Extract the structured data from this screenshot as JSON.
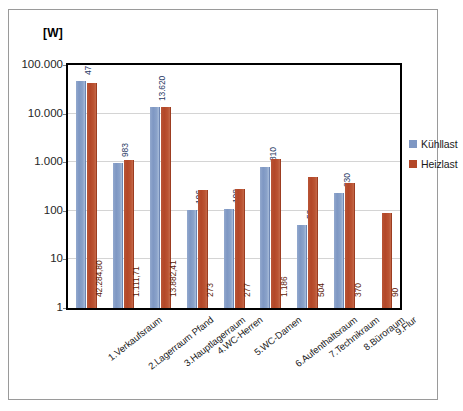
{
  "chart_data": {
    "type": "bar",
    "title": "",
    "subtitle": "",
    "unit_label": "[W]",
    "xlabel": "",
    "ylabel": "",
    "yscale": "log",
    "ylim": [
      1,
      100000
    ],
    "grid": true,
    "legend_position": "right",
    "ytick_labels": [
      "100.000",
      "10.000",
      "1.000",
      "100",
      "10",
      "1"
    ],
    "ytick_values": [
      100000,
      10000,
      1000,
      100,
      10,
      1
    ],
    "categories": [
      "1.Verkaufsraum",
      "2.Lagerraum Pfand",
      "3.Hauptlagerraum",
      "4.WC-Herren",
      "5.WC-Damen",
      "6.Aufenthaltsraum",
      "7.Technikraum",
      "8.Büroraum",
      "9.Flur"
    ],
    "series": [
      {
        "name": "Kühllast",
        "color": "#7e97c3",
        "values": [
          47921,
          983,
          13620,
          106,
          108,
          810,
          50,
          230,
          null
        ],
        "labels": [
          "47.921",
          "983",
          "13.620",
          "106",
          "108",
          "810",
          "50",
          "230",
          ""
        ]
      },
      {
        "name": "Heizlast",
        "color": "#b34728",
        "values": [
          42284.8,
          1111.71,
          13882.41,
          273,
          277,
          1186,
          504,
          370,
          90
        ],
        "labels": [
          "42.284,80",
          "1.111,71",
          "13.882,41",
          "273",
          "277",
          "1.186",
          "504",
          "370",
          "90"
        ]
      }
    ],
    "legend": [
      {
        "label": "Kühllast",
        "color": "#7e97c3"
      },
      {
        "label": "Heizlast",
        "color": "#b34728"
      }
    ]
  }
}
